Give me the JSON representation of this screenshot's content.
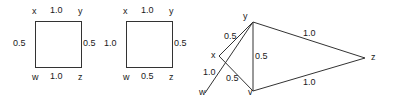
{
  "figure": {
    "background_color": "#ffffff",
    "stroke_color": "#333333",
    "text_color": "#1a1a1a",
    "panels": [
      {
        "id": "square-1",
        "type": "undirected-graph",
        "shape": "square",
        "nodes": [
          {
            "id": "x",
            "label": "x",
            "position": "top-left"
          },
          {
            "id": "y",
            "label": "y",
            "position": "top-right"
          },
          {
            "id": "w",
            "label": "w",
            "position": "bottom-left"
          },
          {
            "id": "z",
            "label": "z",
            "position": "bottom-right"
          }
        ],
        "edges": [
          {
            "from": "x",
            "to": "y",
            "weight": "1.0",
            "side": "top"
          },
          {
            "from": "x",
            "to": "w",
            "weight": "0.5",
            "side": "left"
          },
          {
            "from": "y",
            "to": "z",
            "weight": "0.5",
            "side": "right"
          },
          {
            "from": "w",
            "to": "z",
            "weight": "1.0",
            "side": "bottom"
          }
        ]
      },
      {
        "id": "square-2",
        "type": "undirected-graph",
        "shape": "square",
        "nodes": [
          {
            "id": "x",
            "label": "x",
            "position": "top-left"
          },
          {
            "id": "y",
            "label": "y",
            "position": "top-right"
          },
          {
            "id": "w",
            "label": "w",
            "position": "bottom-left"
          },
          {
            "id": "z",
            "label": "z",
            "position": "bottom-right"
          }
        ],
        "edges": [
          {
            "from": "x",
            "to": "y",
            "weight": "1.0",
            "side": "top"
          },
          {
            "from": "x",
            "to": "w",
            "weight": "1.0",
            "side": "left"
          },
          {
            "from": "y",
            "to": "z",
            "weight": "0.5",
            "side": "right"
          },
          {
            "from": "w",
            "to": "z",
            "weight": "0.5",
            "side": "bottom"
          }
        ]
      },
      {
        "id": "triangle-fan",
        "type": "undirected-graph",
        "shape": "fan",
        "nodes": [
          {
            "id": "y",
            "label": "y",
            "position": "top"
          },
          {
            "id": "x",
            "label": "x",
            "position": "mid-left"
          },
          {
            "id": "w",
            "label": "w",
            "position": "bottom-left"
          },
          {
            "id": "v",
            "label": "v",
            "position": "bottom-mid"
          },
          {
            "id": "z",
            "label": "z",
            "position": "right"
          }
        ],
        "edges": [
          {
            "from": "x",
            "to": "y",
            "weight": "0.5"
          },
          {
            "from": "w",
            "to": "v",
            "weight": "1.0"
          },
          {
            "from": "x",
            "to": "v",
            "weight": "0.5"
          },
          {
            "from": "y",
            "to": "v",
            "weight": "0.5"
          },
          {
            "from": "y",
            "to": "z",
            "weight": "1.0"
          },
          {
            "from": "v",
            "to": "z",
            "weight": "1.0"
          }
        ]
      }
    ]
  },
  "labels": {
    "p1": {
      "n_x": "x",
      "n_y": "y",
      "n_w": "w",
      "n_z": "z",
      "w_top": "1.0",
      "w_left": "0.5",
      "w_right": "0.5",
      "w_bottom": "1.0"
    },
    "p2": {
      "n_x": "x",
      "n_y": "y",
      "n_w": "w",
      "n_z": "z",
      "w_top": "1.0",
      "w_left": "1.0",
      "w_right": "0.5",
      "w_bottom": "0.5"
    },
    "p3": {
      "n_y": "y",
      "n_x": "x",
      "n_w": "w",
      "n_v": "v",
      "n_z": "z",
      "w_xy": "0.5",
      "w_wv": "1.0",
      "w_xv": "0.5",
      "w_yv": "0.5",
      "w_yz": "1.0",
      "w_vz": "1.0"
    }
  }
}
